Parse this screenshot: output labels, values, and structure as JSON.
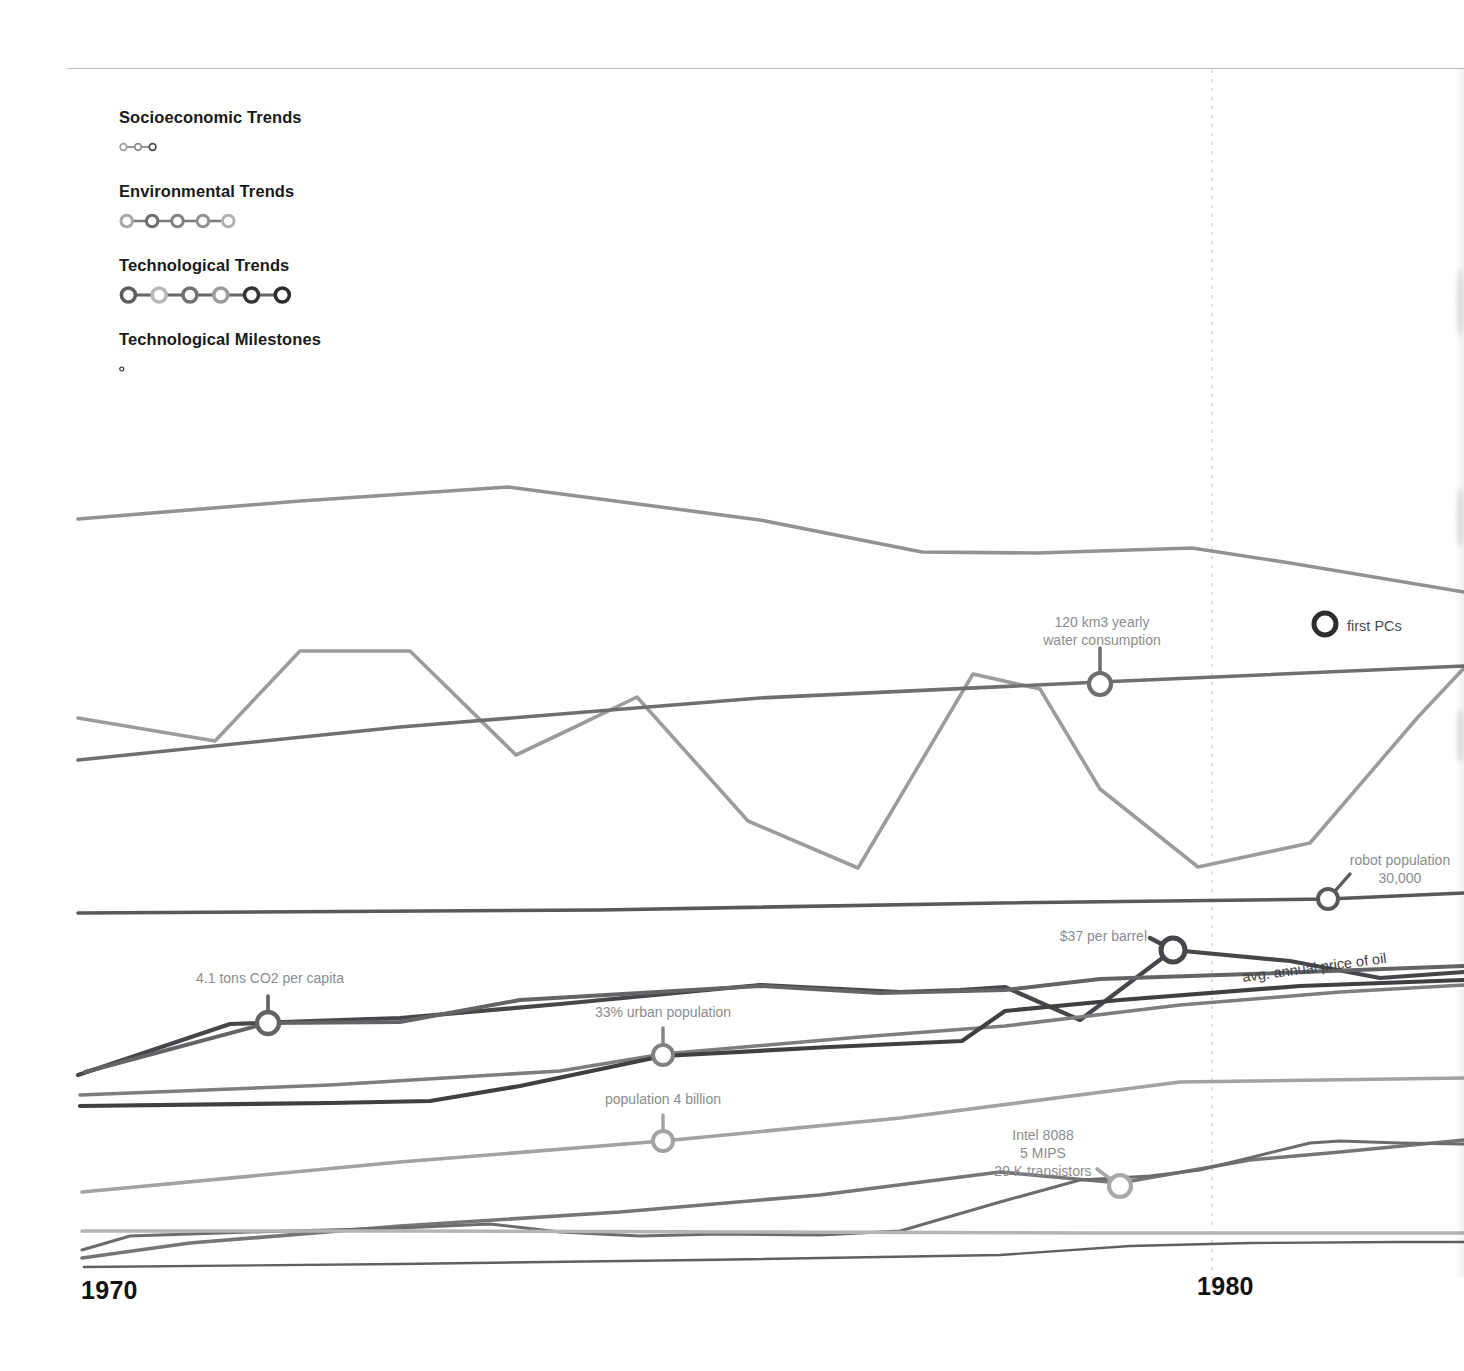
{
  "page": {
    "background": "#ffffff",
    "top_rule_color": "#b9bbbd"
  },
  "legend": {
    "groups": [
      {
        "id": "socioeconomic",
        "label": "Socioeconomic Trends",
        "dot_colors": [
          "#9d9fa1",
          "#8a8c8e",
          "#4a4c4e"
        ],
        "link_color": "#6f7173"
      },
      {
        "id": "environmental",
        "label": "Environmental Trends",
        "dot_colors": [
          "#a6a8aa",
          "#6b6d6f",
          "#808284",
          "#8f9193",
          "#b0b2b4"
        ],
        "link_color": "#77797b"
      },
      {
        "id": "technological",
        "label": "Technological Trends",
        "dot_colors": [
          "#5b5d5f",
          "#b6b8ba",
          "#707274",
          "#9a9c9e",
          "#333537",
          "#2b2d2f"
        ],
        "link_color": "#67696b"
      },
      {
        "id": "milestones",
        "label": "Technological Milestones",
        "dot_colors": [
          "#2b2d2f"
        ],
        "link_color": "#2b2d2f"
      }
    ]
  },
  "axis": {
    "years": [
      "1970",
      "1980"
    ],
    "marker_line": {
      "x": 1212,
      "y_top": 70,
      "y_bottom": 1290,
      "color": "#c9cbcd",
      "dash": "3 6"
    }
  },
  "chart_data": {
    "type": "line",
    "title": "",
    "xlabel": "",
    "ylabel": "",
    "x_domain": [
      1969.3,
      1983.6
    ],
    "x_ticks": [
      1970,
      1980
    ],
    "grid": false,
    "legend_position": "top-left",
    "note": "Pixel-space polylines; x in px across a 1464px canvas, y in px down a 1371px canvas.",
    "series": [
      {
        "name": "energy use index",
        "group": "environmental",
        "color": "#909294",
        "width": 3.6,
        "points": [
          [
            78,
            519
          ],
          [
            300,
            501
          ],
          [
            508,
            487
          ],
          [
            760,
            520
          ],
          [
            922,
            552
          ],
          [
            1037,
            553
          ],
          [
            1192,
            548
          ],
          [
            1290,
            563
          ],
          [
            1464,
            592
          ]
        ]
      },
      {
        "name": "fertilizer consumption",
        "group": "environmental",
        "color": "#9a9c9e",
        "width": 3.6,
        "points": [
          [
            78,
            718
          ],
          [
            215,
            741
          ],
          [
            300,
            651
          ],
          [
            410,
            651
          ],
          [
            516,
            755
          ],
          [
            577,
            726
          ],
          [
            637,
            697
          ],
          [
            748,
            821
          ],
          [
            858,
            868
          ],
          [
            973,
            674
          ],
          [
            1040,
            689
          ],
          [
            1100,
            789
          ],
          [
            1198,
            867
          ],
          [
            1310,
            843
          ],
          [
            1418,
            717
          ],
          [
            1464,
            668
          ]
        ]
      },
      {
        "name": "water consumption",
        "group": "environmental",
        "color": "#6d6f71",
        "width": 3.6,
        "points": [
          [
            78,
            760
          ],
          [
            400,
            727
          ],
          [
            760,
            698
          ],
          [
            1100,
            682
          ],
          [
            1464,
            666
          ]
        ]
      },
      {
        "name": "robot population",
        "group": "technological",
        "color": "#57595b",
        "width": 3.6,
        "points": [
          [
            78,
            913
          ],
          [
            600,
            910
          ],
          [
            1000,
            903
          ],
          [
            1328,
            899
          ],
          [
            1464,
            893
          ]
        ]
      },
      {
        "name": "avg. annual price of oil",
        "group": "socioeconomic",
        "color": "#45474a",
        "width": 4.2,
        "points": [
          [
            78,
            1075
          ],
          [
            230,
            1024
          ],
          [
            400,
            1018
          ],
          [
            560,
            1004
          ],
          [
            760,
            985
          ],
          [
            900,
            992
          ],
          [
            960,
            990
          ],
          [
            1005,
            987
          ],
          [
            1080,
            1020
          ],
          [
            1173,
            950
          ],
          [
            1290,
            961
          ],
          [
            1380,
            978
          ],
          [
            1464,
            972
          ]
        ]
      },
      {
        "name": "co2 per capita",
        "group": "environmental",
        "color": "#626466",
        "width": 4.0,
        "points": [
          [
            85,
            1072
          ],
          [
            268,
            1023
          ],
          [
            400,
            1022
          ],
          [
            520,
            1000
          ],
          [
            760,
            986
          ],
          [
            880,
            993
          ],
          [
            1005,
            990
          ],
          [
            1100,
            979
          ],
          [
            1250,
            974
          ],
          [
            1464,
            966
          ]
        ]
      },
      {
        "name": "urban population",
        "group": "socioeconomic",
        "color": "#7c7e80",
        "width": 3.6,
        "points": [
          [
            80,
            1095
          ],
          [
            330,
            1085
          ],
          [
            560,
            1071
          ],
          [
            663,
            1054
          ],
          [
            860,
            1037
          ],
          [
            1005,
            1026
          ],
          [
            1180,
            1005
          ],
          [
            1340,
            992
          ],
          [
            1464,
            985
          ]
        ]
      },
      {
        "name": "gdp index",
        "group": "socioeconomic",
        "color": "#3e4042",
        "width": 4.2,
        "points": [
          [
            80,
            1106
          ],
          [
            330,
            1103
          ],
          [
            430,
            1101
          ],
          [
            520,
            1086
          ],
          [
            663,
            1056
          ],
          [
            830,
            1047
          ],
          [
            962,
            1041
          ],
          [
            1005,
            1011
          ],
          [
            1120,
            1000
          ],
          [
            1300,
            986
          ],
          [
            1464,
            980
          ]
        ]
      },
      {
        "name": "world population",
        "group": "socioeconomic",
        "color": "#a0a2a4",
        "width": 3.6,
        "points": [
          [
            82,
            1192
          ],
          [
            400,
            1162
          ],
          [
            663,
            1141
          ],
          [
            900,
            1118
          ],
          [
            1180,
            1082
          ],
          [
            1464,
            1078
          ]
        ]
      },
      {
        "name": "computing power",
        "group": "technological",
        "color": "#747678",
        "width": 3.6,
        "points": [
          [
            82,
            1258
          ],
          [
            190,
            1243
          ],
          [
            400,
            1226
          ],
          [
            620,
            1212
          ],
          [
            820,
            1195
          ],
          [
            1000,
            1172
          ],
          [
            1120,
            1183
          ],
          [
            1250,
            1160
          ],
          [
            1340,
            1152
          ],
          [
            1464,
            1140
          ]
        ]
      },
      {
        "name": "telephone lines",
        "group": "technological",
        "color": "#6a6c6e",
        "width": 3.0,
        "points": [
          [
            82,
            1250
          ],
          [
            130,
            1236
          ],
          [
            250,
            1232
          ],
          [
            400,
            1228
          ],
          [
            490,
            1224
          ],
          [
            560,
            1232
          ],
          [
            640,
            1236
          ],
          [
            720,
            1234
          ],
          [
            820,
            1235
          ],
          [
            900,
            1231
          ],
          [
            1000,
            1202
          ],
          [
            1080,
            1180
          ],
          [
            1150,
            1176
          ],
          [
            1200,
            1170
          ],
          [
            1310,
            1143
          ],
          [
            1340,
            1141
          ],
          [
            1400,
            1143
          ],
          [
            1464,
            1144
          ]
        ]
      },
      {
        "name": "paper consumption",
        "group": "environmental",
        "color": "#b2b4b6",
        "width": 3.4,
        "points": [
          [
            82,
            1231
          ],
          [
            400,
            1231
          ],
          [
            760,
            1232
          ],
          [
            1100,
            1233
          ],
          [
            1464,
            1233
          ]
        ]
      },
      {
        "name": "motor vehicles",
        "group": "technological",
        "color": "#5e6062",
        "width": 2.4,
        "points": [
          [
            84,
            1267
          ],
          [
            400,
            1264
          ],
          [
            700,
            1260
          ],
          [
            1000,
            1255
          ],
          [
            1130,
            1246
          ],
          [
            1250,
            1243
          ],
          [
            1400,
            1242
          ],
          [
            1464,
            1242
          ]
        ]
      }
    ],
    "annotations": [
      {
        "id": "water-consumption",
        "text_lines": [
          "120 km3 yearly",
          "water consumption"
        ],
        "text_x": 1102,
        "text_y": 627,
        "text_anchor": "middle",
        "node_x": 1100,
        "node_y": 684,
        "leader": [
          [
            1100,
            684
          ],
          [
            1100,
            648
          ]
        ],
        "node_color": "#6d6f71",
        "node_r": 11,
        "node_sw": 4.2
      },
      {
        "id": "first-pcs",
        "text_lines": [
          "first PCs"
        ],
        "text_x": 1347,
        "text_y": 631,
        "text_anchor": "start",
        "node_x": 1325,
        "node_y": 624,
        "leader": [],
        "node_color": "#2b2d2f",
        "node_r": 11,
        "node_sw": 5.0,
        "style": "milestone"
      },
      {
        "id": "robot-population",
        "text_lines": [
          "robot population",
          "30,000"
        ],
        "text_x": 1400,
        "text_y": 865,
        "text_anchor": "middle",
        "node_x": 1328,
        "node_y": 899,
        "leader": [
          [
            1328,
            899
          ],
          [
            1350,
            874
          ]
        ],
        "node_color": "#57595b",
        "node_r": 10,
        "node_sw": 4.0
      },
      {
        "id": "oil-price",
        "text_lines": [
          "$37 per barrel"
        ],
        "text_x": 1147,
        "text_y": 941,
        "text_anchor": "end",
        "node_x": 1173,
        "node_y": 950,
        "leader": [
          [
            1173,
            950
          ],
          [
            1150,
            938
          ]
        ],
        "node_color": "#45474a",
        "node_r": 12,
        "node_sw": 5.0
      },
      {
        "id": "co2-per-capita",
        "text_lines": [
          "4.1 tons CO2 per capita"
        ],
        "text_x": 270,
        "text_y": 983,
        "text_anchor": "middle",
        "node_x": 268,
        "node_y": 1023,
        "leader": [
          [
            268,
            1023
          ],
          [
            268,
            996
          ]
        ],
        "node_color": "#626466",
        "node_r": 11,
        "node_sw": 4.4
      },
      {
        "id": "urban-population",
        "text_lines": [
          "33% urban population"
        ],
        "text_x": 663,
        "text_y": 1017,
        "text_anchor": "middle",
        "node_x": 663,
        "node_y": 1055,
        "leader": [
          [
            663,
            1055
          ],
          [
            663,
            1028
          ]
        ],
        "node_color": "#808284",
        "node_r": 10,
        "node_sw": 4.0
      },
      {
        "id": "population-4-billion",
        "text_lines": [
          "population 4 billion"
        ],
        "text_x": 663,
        "text_y": 1104,
        "text_anchor": "middle",
        "node_x": 663,
        "node_y": 1141,
        "leader": [
          [
            663,
            1141
          ],
          [
            663,
            1115
          ]
        ],
        "node_color": "#a0a2a4",
        "node_r": 10,
        "node_sw": 4.0
      },
      {
        "id": "intel-8088",
        "text_lines": [
          "Intel 8088",
          "5 MIPS",
          "29 K transistors"
        ],
        "text_x": 1043,
        "text_y": 1140,
        "text_anchor": "middle",
        "node_x": 1120,
        "node_y": 1186,
        "leader": [
          [
            1120,
            1186
          ],
          [
            1097,
            1169
          ]
        ],
        "node_color": "#a6a8aa",
        "node_r": 11,
        "node_sw": 4.2
      }
    ],
    "curve_labels": [
      {
        "id": "avg-annual-price-of-oil",
        "text": "avg. annual price of oil",
        "path": "M 1243 982 L 1400 961",
        "color": "#3f4143"
      }
    ]
  }
}
